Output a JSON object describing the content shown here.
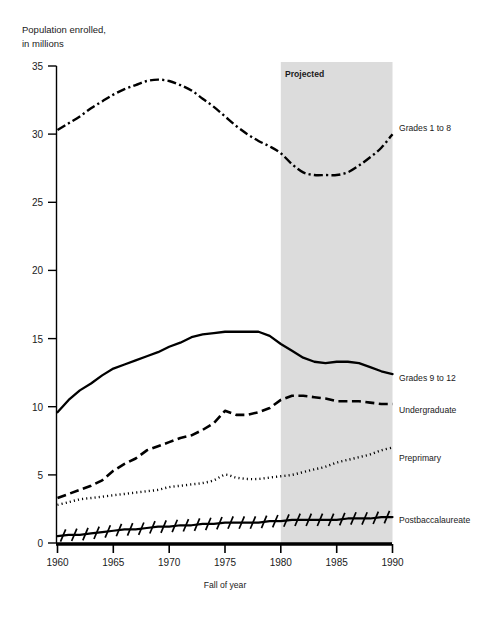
{
  "chart_data": {
    "type": "line",
    "title": "",
    "subtitle": "",
    "ylabel_line1": "Population enrolled,",
    "ylabel_line2": "in millions",
    "xlabel": "Fall of year",
    "xlim": [
      1960,
      1990
    ],
    "ylim": [
      0,
      35
    ],
    "yticks": [
      0,
      5,
      10,
      15,
      20,
      25,
      30,
      35
    ],
    "ytick_labels": [
      "0",
      "5",
      "10",
      "15",
      "20",
      "25",
      "30",
      "35"
    ],
    "xticks": [
      1960,
      1965,
      1970,
      1975,
      1980,
      1985,
      1990
    ],
    "xtick_labels": [
      "1960",
      "1965",
      "1970",
      "1975",
      "1980",
      "1985",
      "1990"
    ],
    "grid": false,
    "legend_position": "right-inline",
    "annotations": [
      {
        "name": "projected-region",
        "text": "Projected",
        "x_start": 1980,
        "x_end": 1990,
        "shade_color": "#dcdcdc"
      }
    ],
    "x": [
      1960,
      1961,
      1962,
      1963,
      1964,
      1965,
      1966,
      1967,
      1968,
      1969,
      1970,
      1971,
      1972,
      1973,
      1974,
      1975,
      1976,
      1977,
      1978,
      1979,
      1980,
      1981,
      1982,
      1983,
      1984,
      1985,
      1986,
      1987,
      1988,
      1989,
      1990
    ],
    "series": [
      {
        "name": "Grades 1 to 8",
        "style": "dashdot",
        "label": "Grades 1 to 8",
        "label_year": 1990,
        "label_value": 30.0,
        "values": [
          30.3,
          30.8,
          31.3,
          31.9,
          32.4,
          32.9,
          33.3,
          33.6,
          33.9,
          34.0,
          33.9,
          33.6,
          33.2,
          32.6,
          32.0,
          31.3,
          30.6,
          30.0,
          29.5,
          29.1,
          28.6,
          27.8,
          27.2,
          27.0,
          27.0,
          27.0,
          27.2,
          27.7,
          28.3,
          29.0,
          30.0
        ]
      },
      {
        "name": "Grades 9 to 12",
        "style": "solid",
        "label": "Grades 9 to 12",
        "label_year": 1990,
        "label_value": 12.4,
        "values": [
          9.6,
          10.5,
          11.2,
          11.7,
          12.3,
          12.8,
          13.1,
          13.4,
          13.7,
          14.0,
          14.4,
          14.7,
          15.1,
          15.3,
          15.4,
          15.5,
          15.5,
          15.5,
          15.5,
          15.2,
          14.6,
          14.1,
          13.6,
          13.3,
          13.2,
          13.3,
          13.3,
          13.2,
          12.9,
          12.6,
          12.4
        ]
      },
      {
        "name": "Undergraduate",
        "style": "dashed",
        "label": "Undergraduate",
        "label_year": 1990,
        "label_value": 10.2,
        "values": [
          3.3,
          3.6,
          3.9,
          4.2,
          4.6,
          5.3,
          5.8,
          6.2,
          6.8,
          7.1,
          7.4,
          7.7,
          7.9,
          8.3,
          8.8,
          9.7,
          9.4,
          9.4,
          9.6,
          9.9,
          10.5,
          10.8,
          10.8,
          10.7,
          10.6,
          10.4,
          10.4,
          10.4,
          10.3,
          10.2,
          10.2
        ]
      },
      {
        "name": "Preprimary",
        "style": "dotted",
        "label": "Preprimary",
        "label_year": 1990,
        "label_value": 7.0,
        "values": [
          2.8,
          3.0,
          3.2,
          3.3,
          3.4,
          3.5,
          3.6,
          3.7,
          3.8,
          3.9,
          4.1,
          4.2,
          4.3,
          4.4,
          4.6,
          5.0,
          4.8,
          4.7,
          4.7,
          4.8,
          4.9,
          5.0,
          5.2,
          5.4,
          5.6,
          5.9,
          6.1,
          6.3,
          6.5,
          6.8,
          7.0
        ]
      },
      {
        "name": "Postbaccalaureate",
        "style": "solid-hatched",
        "label": "Postbaccalaureate",
        "label_year": 1990,
        "label_value": 1.9,
        "values": [
          0.5,
          0.6,
          0.6,
          0.7,
          0.8,
          0.9,
          1.0,
          1.0,
          1.1,
          1.2,
          1.2,
          1.3,
          1.3,
          1.4,
          1.4,
          1.5,
          1.5,
          1.5,
          1.5,
          1.6,
          1.6,
          1.7,
          1.7,
          1.7,
          1.7,
          1.7,
          1.8,
          1.8,
          1.8,
          1.9,
          1.9
        ]
      }
    ]
  },
  "axis": {
    "ylabel_line1": "Population enrolled,",
    "ylabel_line2": "in millions",
    "xlabel": "Fall of year"
  },
  "projected": {
    "label": "Projected"
  },
  "series_labels": {
    "grades_1_to_8": "Grades 1 to 8",
    "grades_9_to_12": "Grades 9 to 12",
    "undergraduate": "Undergraduate",
    "preprimary": "Preprimary",
    "postbaccalaureate": "Postbaccalaureate"
  },
  "yticks": {
    "t0": "0",
    "t5": "5",
    "t10": "10",
    "t15": "15",
    "t20": "20",
    "t25": "25",
    "t30": "30",
    "t35": "35"
  },
  "xticks": {
    "x1960": "1960",
    "x1965": "1965",
    "x1970": "1970",
    "x1975": "1975",
    "x1980": "1980",
    "x1985": "1985",
    "x1990": "1990"
  }
}
